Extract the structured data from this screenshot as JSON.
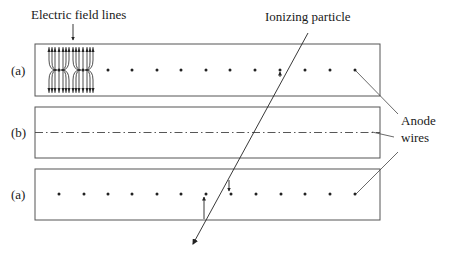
{
  "diagram": {
    "labels": {
      "field_lines": "Electric field lines",
      "ionizing_particle": "Ionizing particle",
      "anode_line1": "Anode",
      "anode_line2": "wires",
      "panel_top": "(a)",
      "panel_middle": "(b)",
      "panel_bottom": "(a)"
    },
    "panels": [
      {
        "id": "top",
        "view": "(a)",
        "description": "cross-section with anode wires as dots and field lines"
      },
      {
        "id": "middle",
        "view": "(b)",
        "description": "side view with anode wire as dash-dot line"
      },
      {
        "id": "bottom",
        "view": "(a)",
        "description": "cross-section with ionization drift arrows"
      }
    ],
    "wire_count_per_row": 13,
    "colors": {
      "stroke": "#333333",
      "text": "#1a1a1a",
      "background": "#ffffff"
    }
  }
}
